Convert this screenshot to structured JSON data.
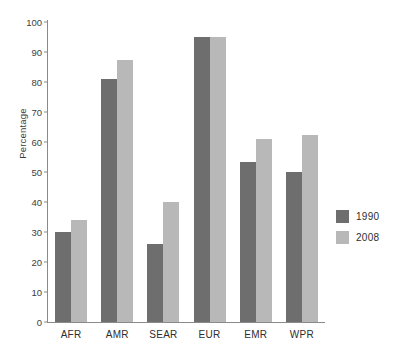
{
  "chart_data": {
    "type": "bar",
    "title": "",
    "xlabel": "",
    "ylabel": "Percentage",
    "ylim": [
      0,
      100
    ],
    "ytick_step": 10,
    "yticks": [
      0,
      10,
      20,
      30,
      40,
      50,
      60,
      70,
      80,
      90,
      100
    ],
    "grid": false,
    "legend_position": "right",
    "categories": [
      "AFR",
      "AMR",
      "SEAR",
      "EUR",
      "EMR",
      "WPR"
    ],
    "series": [
      {
        "name": "1990",
        "color": "#6e6e6e",
        "values": [
          30,
          81,
          26,
          95,
          53.5,
          50
        ]
      },
      {
        "name": "2008",
        "color": "#b8b8b8",
        "values": [
          34,
          87.5,
          40,
          95,
          61,
          62.5
        ]
      }
    ]
  },
  "legend": {
    "items": [
      {
        "label": "1990",
        "color": "#6e6e6e"
      },
      {
        "label": "2008",
        "color": "#b8b8b8"
      }
    ]
  },
  "axes": {
    "y_title": "Percentage",
    "axis_color": "#8a8a8a"
  }
}
